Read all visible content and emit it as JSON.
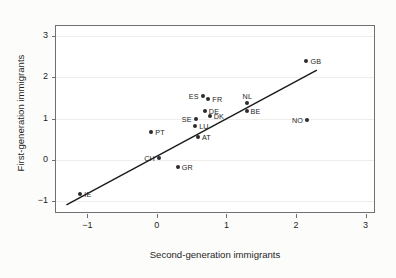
{
  "chart_data": {
    "type": "scatter",
    "title": "",
    "xlabel": "Second-generation immigrants",
    "ylabel": "First-generation immigrants",
    "xlim": [
      -1.45,
      3.15
    ],
    "ylim": [
      -1.32,
      3.25
    ],
    "xticks": [
      -1,
      0,
      1,
      2,
      3
    ],
    "xticklabels": [
      "−1",
      "0",
      "1",
      "2",
      "3"
    ],
    "yticks": [
      -1,
      0,
      1,
      2,
      3
    ],
    "yticklabels": [
      "−1",
      "0",
      "1",
      "2",
      "3"
    ],
    "grid": "horizontal-faint",
    "legend": "none",
    "points": [
      {
        "label": "GB",
        "x": 2.15,
        "y": 2.4,
        "label_pos": "right"
      },
      {
        "label": "ES",
        "x": 0.66,
        "y": 1.55,
        "label_pos": "left"
      },
      {
        "label": "FR",
        "x": 0.74,
        "y": 1.47,
        "label_pos": "right"
      },
      {
        "label": "NL",
        "x": 1.3,
        "y": 1.37,
        "label_pos": "above"
      },
      {
        "label": "DE",
        "x": 0.69,
        "y": 1.19,
        "label_pos": "right"
      },
      {
        "label": "BE",
        "x": 1.29,
        "y": 1.18,
        "label_pos": "right"
      },
      {
        "label": "DK",
        "x": 0.76,
        "y": 1.07,
        "label_pos": "right"
      },
      {
        "label": "SE",
        "x": 0.56,
        "y": 0.99,
        "label_pos": "left"
      },
      {
        "label": "NO",
        "x": 2.16,
        "y": 0.96,
        "label_pos": "left"
      },
      {
        "label": "LU",
        "x": 0.55,
        "y": 0.83,
        "label_pos": "right"
      },
      {
        "label": "PT",
        "x": -0.08,
        "y": 0.68,
        "label_pos": "right"
      },
      {
        "label": "AT",
        "x": 0.59,
        "y": 0.55,
        "label_pos": "right"
      },
      {
        "label": "CH",
        "x": 0.03,
        "y": 0.05,
        "label_pos": "left"
      },
      {
        "label": "GR",
        "x": 0.3,
        "y": -0.17,
        "label_pos": "right"
      },
      {
        "label": "IE",
        "x": -1.1,
        "y": -0.84,
        "label_pos": "right"
      }
    ],
    "trendline": {
      "type": "linear-fit",
      "x_start": -1.3,
      "y_start": -1.1,
      "x_end": 2.3,
      "y_end": 2.18,
      "color": "#1a1a1a"
    },
    "colors": {
      "point": "#2b2b2b",
      "frame": "#6f7072",
      "grid": "#f0eeec",
      "text": "#1f1f1f",
      "background": "#ffffff",
      "figure_background": "#fcfcfa"
    }
  }
}
